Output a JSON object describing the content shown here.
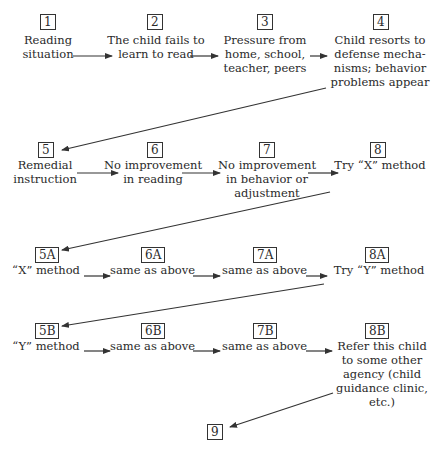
{
  "nodes": [
    {
      "id": "1",
      "lines": [
        "Reading",
        "situation"
      ]
    },
    {
      "id": "2",
      "lines": [
        "The child fails to",
        "learn to read"
      ]
    },
    {
      "id": "3",
      "lines": [
        "Pressure from",
        "home,  school,",
        "teacher, peers"
      ]
    },
    {
      "id": "4",
      "lines": [
        "Child  resorts  to",
        "defense  mecha-",
        "nisms;  behavior",
        "problems appear"
      ]
    },
    {
      "id": "5",
      "lines": [
        "Remedial",
        "instruction"
      ]
    },
    {
      "id": "6",
      "lines": [
        "No improvement",
        "in reading"
      ]
    },
    {
      "id": "7",
      "lines": [
        "No improvement",
        "in behavior or",
        "adjustment"
      ]
    },
    {
      "id": "8",
      "lines": [
        "Try “X” method"
      ]
    },
    {
      "id": "5A",
      "lines": [
        "“X” method"
      ]
    },
    {
      "id": "6A",
      "lines": [
        "same as above"
      ]
    },
    {
      "id": "7A",
      "lines": [
        "same as above"
      ]
    },
    {
      "id": "8A",
      "lines": [
        "Try “Y” method"
      ]
    },
    {
      "id": "5B",
      "lines": [
        "“Y” method"
      ]
    },
    {
      "id": "6B",
      "lines": [
        "same as above"
      ]
    },
    {
      "id": "7B",
      "lines": [
        "same as above"
      ]
    },
    {
      "id": "8B",
      "lines": [
        "Refer this child",
        "to  some  other",
        "agency  (child",
        "guidance clinic,",
        "etc.)"
      ]
    },
    {
      "id": "9",
      "lines": []
    }
  ],
  "edges": [
    [
      "1",
      "2"
    ],
    [
      "2",
      "3"
    ],
    [
      "3",
      "4"
    ],
    [
      "4",
      "5"
    ],
    [
      "5",
      "6"
    ],
    [
      "6",
      "7"
    ],
    [
      "7",
      "8"
    ],
    [
      "8",
      "5A"
    ],
    [
      "5A",
      "6A"
    ],
    [
      "6A",
      "7A"
    ],
    [
      "7A",
      "8A"
    ],
    [
      "8A",
      "5B"
    ],
    [
      "5B",
      "6B"
    ],
    [
      "6B",
      "7B"
    ],
    [
      "7B",
      "8B"
    ],
    [
      "8B",
      "9"
    ]
  ]
}
